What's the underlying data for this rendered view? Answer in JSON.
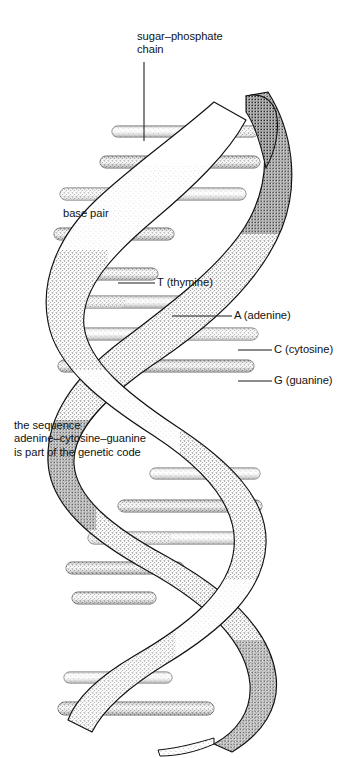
{
  "figure": {
    "background_color": "#ffffff",
    "ink_color": "#1a1a1a",
    "style": "stippled pen-and-ink scientific illustration"
  },
  "labels": {
    "sugar_phosphate": {
      "line1": "sugar–phosphate",
      "line2": "chain",
      "name": "sugar-phosphate-chain-label"
    },
    "base_pair": {
      "text": "base pair",
      "name": "base-pair-label"
    },
    "thymine": {
      "text": "T (thymine)",
      "name": "thymine-label"
    },
    "adenine": {
      "text": "A (adenine)",
      "name": "adenine-label"
    },
    "cytosine": {
      "text": "C (cytosine)",
      "name": "cytosine-label"
    },
    "guanine": {
      "text": "G (guanine)",
      "name": "guanine-label"
    },
    "sequence_note": {
      "line1": "the sequence",
      "line2": "adenine–cytosine–guanine",
      "line3": "is part of the genetic code",
      "name": "genetic-code-note"
    }
  },
  "legend_keys": [
    {
      "letter": "T",
      "base": "thymine"
    },
    {
      "letter": "A",
      "base": "adenine"
    },
    {
      "letter": "C",
      "base": "cytosine"
    },
    {
      "letter": "G",
      "base": "guanine"
    }
  ]
}
